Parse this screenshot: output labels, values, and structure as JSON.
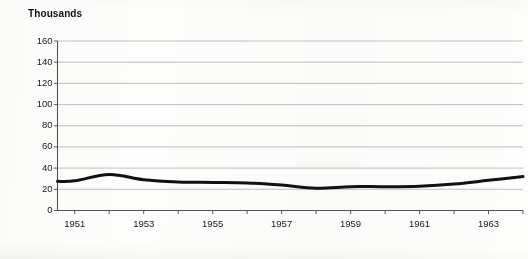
{
  "chart_data": {
    "type": "line",
    "title": "Thousands",
    "xlabel": "",
    "ylabel": "",
    "grid": true,
    "legend": "none",
    "xlim": [
      1950.5,
      1964.0
    ],
    "ylim": [
      0,
      160
    ],
    "yticks": [
      0,
      20,
      40,
      60,
      80,
      100,
      120,
      140,
      160
    ],
    "ytick_labels": [
      "0",
      "20",
      "40",
      "60",
      "80",
      "100",
      "120",
      "140",
      "160"
    ],
    "xticks": [
      1951,
      1952,
      1953,
      1954,
      1955,
      1956,
      1957,
      1958,
      1959,
      1960,
      1961,
      1962,
      1963,
      1964
    ],
    "xtick_labels": [
      "1951",
      "",
      "1953",
      "",
      "1955",
      "",
      "1957",
      "",
      "1959",
      "",
      "1961",
      "",
      "1963",
      ""
    ],
    "x": [
      1950.5,
      1951,
      1952,
      1953,
      1954,
      1955,
      1956,
      1957,
      1958,
      1959,
      1960,
      1961,
      1962,
      1963,
      1964
    ],
    "values": [
      27.5,
      28,
      34,
      29,
      27,
      26.5,
      26,
      24,
      21,
      22.5,
      22.5,
      23,
      25,
      28.5,
      32
    ],
    "series": [
      {
        "name": "series-1",
        "color": "#111111",
        "line_width": 3,
        "values": [
          27.5,
          28,
          34,
          29,
          27,
          26.5,
          26,
          24,
          21,
          22.5,
          22.5,
          23,
          25,
          28.5,
          32
        ]
      }
    ],
    "axis_color": "#555555",
    "grid_color": "#b8b8b8"
  }
}
